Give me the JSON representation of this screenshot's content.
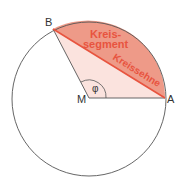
{
  "diagram": {
    "points": {
      "B": {
        "label": "B"
      },
      "M": {
        "label": "M"
      },
      "A": {
        "label": "A"
      }
    },
    "angle_label": "φ",
    "segment_label_line1": "Kreis-",
    "segment_label_line2": "segment",
    "chord_label": "Kreissehne",
    "colors": {
      "circle_stroke": "#555555",
      "segment_fill": "#ee9a88",
      "sector_fill": "#fbe3de",
      "chord": "#e8543f",
      "label_red": "#e8543f",
      "point_label": "#333333"
    }
  }
}
